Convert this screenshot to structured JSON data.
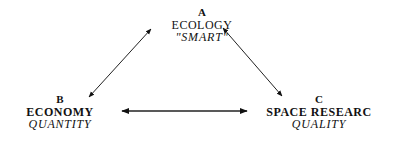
{
  "nodes": {
    "a": {
      "letter": "A",
      "title": "ECOLOGY",
      "subtitle": "\"SMART\""
    },
    "b": {
      "letter": "B",
      "title": "ECONOMY",
      "subtitle": "QUANTITY"
    },
    "c": {
      "letter": "C",
      "title": "SPACE RESEARC",
      "subtitle": "QUALITY"
    }
  },
  "edges": [
    {
      "from": "A",
      "to": "B",
      "type": "bidirectional"
    },
    {
      "from": "A",
      "to": "C",
      "type": "bidirectional"
    },
    {
      "from": "B",
      "to": "C",
      "type": "bidirectional"
    }
  ],
  "colors": {
    "ink": "#111111",
    "background": "#ffffff"
  }
}
